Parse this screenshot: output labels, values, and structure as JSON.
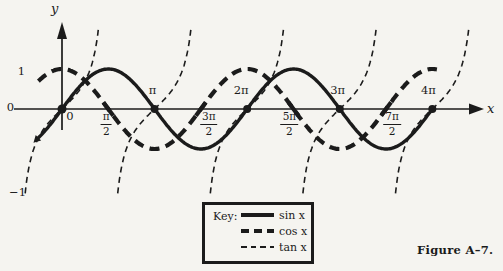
{
  "figure": {
    "caption": "Figure A–7."
  },
  "key": {
    "title": "Key:",
    "entries": [
      {
        "label": "sin x",
        "line_style": "solid"
      },
      {
        "label": "cos x",
        "line_style": "dashed-thick"
      },
      {
        "label": "tan x",
        "line_style": "dashed-thin"
      }
    ]
  },
  "colors": {
    "ink": "#1b1b1b",
    "paper": "#f5f4f0"
  },
  "chart_data": {
    "type": "line",
    "title": "",
    "xlabel": "x",
    "ylabel": "y",
    "x_unit": "radians",
    "xlim_rad": [
      -1.6,
      14.3
    ],
    "ylim": [
      -3,
      3
    ],
    "grid": false,
    "legend_position": "bottom-center-box",
    "series": [
      {
        "name": "sin x",
        "fn": "sin",
        "style": "solid-thick",
        "domain": [
          -0.8,
          12.5664
        ]
      },
      {
        "name": "cos x",
        "fn": "cos",
        "style": "dashed-thick",
        "domain": [
          -0.8,
          12.75
        ]
      },
      {
        "name": "tan x",
        "fn": "tan",
        "style": "dashed-thin",
        "branch_centers": [
          0,
          3.1416,
          6.2832,
          9.4248,
          12.5664
        ],
        "branch_halfwidth": 1.25
      }
    ],
    "samples": {
      "x_over_pi": [
        0,
        0.5,
        1,
        1.5,
        2,
        2.5,
        3,
        3.5,
        4
      ],
      "sin": [
        0,
        1,
        0,
        -1,
        0,
        1,
        0,
        -1,
        0
      ],
      "cos": [
        1,
        0,
        -1,
        0,
        1,
        0,
        -1,
        0,
        1
      ],
      "tan": [
        0,
        null,
        0,
        null,
        0,
        null,
        0,
        null,
        0
      ]
    },
    "x_ticks": [
      {
        "id": "0",
        "style": "plain",
        "label": "0",
        "rad": 0,
        "side": "below",
        "dx": 8
      },
      {
        "id": "pi-2",
        "style": "fraction",
        "num": "π",
        "den": "2",
        "rad": 1.5708,
        "side": "below",
        "dx": -2
      },
      {
        "id": "pi",
        "style": "plain",
        "label": "π",
        "rad": 3.1416,
        "side": "above",
        "dx": -2
      },
      {
        "id": "3pi-2",
        "style": "fraction",
        "num": "3π",
        "den": "2",
        "rad": 4.7124,
        "side": "below",
        "dx": 8
      },
      {
        "id": "2pi",
        "style": "plain",
        "label": "2π",
        "rad": 6.2832,
        "side": "above",
        "dx": -6
      },
      {
        "id": "5pi-2",
        "style": "fraction",
        "num": "5π",
        "den": "2",
        "rad": 7.854,
        "side": "below",
        "dx": -4
      },
      {
        "id": "3pi",
        "style": "plain",
        "label": "3π",
        "rad": 9.4248,
        "side": "above",
        "dx": -2
      },
      {
        "id": "7pi-2",
        "style": "fraction",
        "num": "7π",
        "den": "2",
        "rad": 10.9956,
        "side": "below",
        "dx": 6
      },
      {
        "id": "4pi",
        "style": "plain",
        "label": "4π",
        "rad": 12.5664,
        "side": "above",
        "dx": -4
      }
    ],
    "y_ticks": [
      {
        "id": "1",
        "label": "1",
        "value": 1
      },
      {
        "id": "0",
        "label": "0",
        "value": 0
      },
      {
        "id": "n1",
        "label": "−1",
        "value": -1
      }
    ],
    "axis_crossing_dots_rad": [
      0,
      3.1416,
      6.2832,
      9.4248,
      12.5664
    ],
    "cos_axis_marks_rad": [
      1.5708,
      4.7124,
      7.854,
      10.9956
    ],
    "layout": {
      "origin_px": [
        62,
        109
      ],
      "px_per_rad": 29.47,
      "px_per_unit": 40,
      "tan_px_per_unit": 28,
      "x_axis_span_px": [
        14,
        484
      ],
      "y_axis_span_px": [
        22,
        130
      ]
    }
  }
}
